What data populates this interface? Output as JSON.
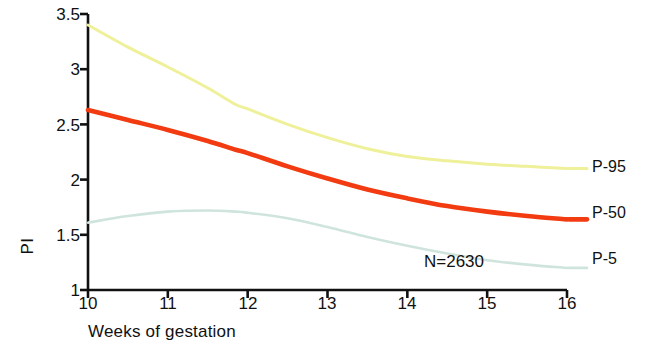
{
  "chart_data": {
    "type": "line",
    "title": "",
    "xlabel": "Weeks of gestation",
    "ylabel": "PI",
    "xlim": [
      10,
      16
    ],
    "ylim": [
      1,
      3.5
    ],
    "xticks": [
      "10",
      "11",
      "12",
      "13",
      "14",
      "15",
      "16"
    ],
    "yticks": [
      "1",
      "1.5",
      "2",
      "2.5",
      "3",
      "3.5"
    ],
    "grid": false,
    "legend_position": "right-outside-inline",
    "annotations": [
      {
        "text": "N=2630",
        "x": 14.2,
        "y": 1.28
      }
    ],
    "x": [
      10,
      10.5,
      11,
      11.5,
      11.85,
      12,
      12.5,
      13,
      13.5,
      14,
      14.5,
      15,
      15.5,
      16
    ],
    "series": [
      {
        "name": "P-95",
        "color": "#EFF09A",
        "label": "P-95",
        "label_value": "2.10",
        "values": [
          3.4,
          3.2,
          3.02,
          2.83,
          2.68,
          2.64,
          2.5,
          2.38,
          2.28,
          2.21,
          2.17,
          2.14,
          2.12,
          2.1
        ]
      },
      {
        "name": "P-50",
        "color": "#F23B10",
        "label": "P-50",
        "label_value": "1.64",
        "values": [
          2.63,
          2.54,
          2.45,
          2.35,
          2.27,
          2.24,
          2.12,
          2.01,
          1.91,
          1.83,
          1.76,
          1.71,
          1.67,
          1.64
        ]
      },
      {
        "name": "P-5",
        "color": "#CFE4DC",
        "label": "P-5",
        "label_value": "1.20",
        "values": [
          1.61,
          1.67,
          1.71,
          1.72,
          1.71,
          1.7,
          1.65,
          1.57,
          1.48,
          1.4,
          1.33,
          1.27,
          1.23,
          1.2
        ]
      }
    ]
  }
}
